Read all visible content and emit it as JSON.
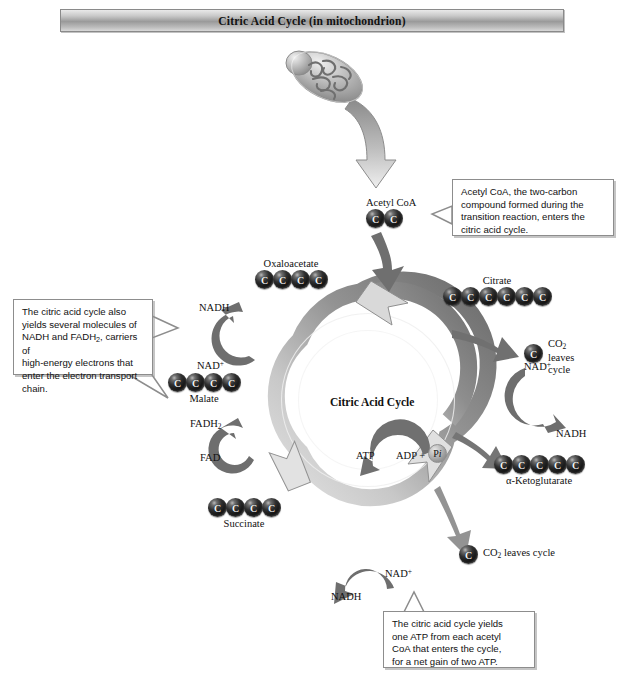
{
  "title": "Citric Acid Cycle (in mitochondrion)",
  "center_label": "Citric Acid Cycle",
  "molecules": {
    "acetyl_coa": {
      "label": "Acetyl CoA",
      "carbons": 2,
      "carbon_letter": "C",
      "label_position": "above"
    },
    "citrate": {
      "label": "Citrate",
      "carbons": 6,
      "carbon_letter": "C",
      "label_position": "above"
    },
    "oxaloacetate": {
      "label": "Oxaloacetate",
      "carbons": 4,
      "carbon_letter": "C",
      "label_position": "above"
    },
    "malate": {
      "label": "Malate",
      "carbons": 4,
      "carbon_letter": "C",
      "label_position": "below"
    },
    "succinate": {
      "label": "Succinate",
      "carbons": 4,
      "carbon_letter": "C",
      "label_position": "below"
    },
    "ketoglutarate": {
      "label": "α-Ketoglutarate",
      "carbons": 5,
      "carbon_letter": "C",
      "label_position": "below"
    },
    "co2_right": {
      "label": "CO2 leaves cycle",
      "carbons": 1,
      "carbon_letter": "C",
      "label_position": "right"
    },
    "co2_bottom": {
      "label": "CO2 leaves cycle",
      "carbons": 1,
      "carbon_letter": "C",
      "label_position": "right"
    }
  },
  "labels": {
    "co2_right_line1": "CO",
    "co2_right_sub": "2",
    "co2_right_line2": "leaves",
    "co2_right_line3": "cycle",
    "co2_bottom_text": "leaves cycle",
    "nadh_upper_left": "NADH",
    "nad_plus_left": "NAD",
    "nad_plus_left_sup": "+",
    "fadh2_text": "FADH",
    "fadh2_sub": "2",
    "fad_text": "FAD",
    "nad_plus_right": "NAD",
    "nad_plus_right_sup": "+",
    "nadh_right": "NADH",
    "nad_plus_bottom": "NAD",
    "nad_plus_bottom_sup": "+",
    "nadh_bottom": "NADH",
    "atp": "ATP",
    "adp_plus": "ADP +",
    "pi": "P",
    "pi_italic": "i"
  },
  "callouts": {
    "acetyl": {
      "lines": [
        "Acetyl CoA, the two-carbon",
        "compound formed during the",
        "transition reaction, enters the",
        "citric acid cycle."
      ]
    },
    "carriers": {
      "line1": "The citric acid cycle also",
      "line2": "yields several molecules of",
      "line3_a": "NADH and FADH",
      "line3_sub": "2",
      "line3_b": ", carriers of",
      "line4": "high-energy electrons that",
      "line5": "enter the electron transport",
      "line6": "chain."
    },
    "atp": {
      "lines": [
        "The citric acid cycle yields",
        "one ATP from each acetyl",
        "CoA that enters the cycle,",
        "for a net gain of two ATP."
      ]
    }
  },
  "colors": {
    "ring_light": "#d8d8d8",
    "ring_dark": "#6f6f6f",
    "arrow_dark": "#6b6b6b",
    "arrow_light": "#d5d5d5",
    "carbon": "#101010",
    "banner_mid": "#9a9a9a"
  }
}
